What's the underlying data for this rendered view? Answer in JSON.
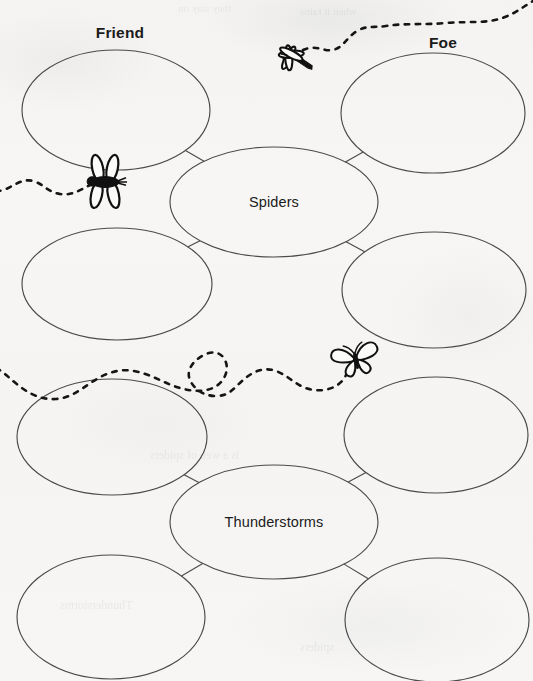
{
  "worksheet": {
    "column_headers": [
      {
        "label": "Friend",
        "x": 120,
        "y": 24
      },
      {
        "label": "Foe",
        "x": 443,
        "y": 34
      }
    ],
    "clusters": [
      {
        "center": {
          "label": "Spiders",
          "cx": 274,
          "cy": 202,
          "rx": 104,
          "ry": 55
        },
        "satellites": [
          {
            "name": "spiders-friend-top",
            "side": "friend",
            "cx": 116,
            "cy": 110,
            "rx": 94,
            "ry": 60,
            "value": ""
          },
          {
            "name": "spiders-foe-top",
            "side": "foe",
            "cx": 433,
            "cy": 113,
            "rx": 92,
            "ry": 60,
            "value": ""
          },
          {
            "name": "spiders-friend-bottom",
            "side": "friend",
            "cx": 117,
            "cy": 284,
            "rx": 95,
            "ry": 56,
            "value": ""
          },
          {
            "name": "spiders-foe-bottom",
            "side": "foe",
            "cx": 434,
            "cy": 290,
            "rx": 92,
            "ry": 58,
            "value": ""
          }
        ]
      },
      {
        "center": {
          "label": "Thunderstorms",
          "cx": 274,
          "cy": 522,
          "rx": 104,
          "ry": 57
        },
        "satellites": [
          {
            "name": "thunderstorms-friend-top",
            "side": "friend",
            "cx": 112,
            "cy": 437,
            "rx": 95,
            "ry": 58,
            "value": ""
          },
          {
            "name": "thunderstorms-foe-top",
            "side": "foe",
            "cx": 436,
            "cy": 435,
            "rx": 92,
            "ry": 58,
            "value": ""
          },
          {
            "name": "thunderstorms-friend-bottom",
            "side": "friend",
            "cx": 111,
            "cy": 617,
            "rx": 94,
            "ry": 62,
            "value": ""
          },
          {
            "name": "thunderstorms-foe-bottom",
            "side": "foe",
            "cx": 437,
            "cy": 620,
            "rx": 92,
            "ry": 62,
            "value": ""
          }
        ]
      }
    ],
    "illustrations": [
      {
        "name": "dragonfly-icon",
        "x": 290,
        "y": 56,
        "rotation": -28,
        "scale": 1.0
      },
      {
        "name": "fly-icon",
        "x": 105,
        "y": 182,
        "rotation": 0,
        "scale": 1.05
      },
      {
        "name": "butterfly-icon",
        "x": 355,
        "y": 358,
        "rotation": -12,
        "scale": 0.95
      }
    ],
    "flight_trails": [
      {
        "name": "dragonfly-trail",
        "path": "M 303 50 C 316 44 324 52 333 50 C 344 47 346 38 357 31 C 367 25 373 28 386 26 C 404 23 424 25 446 23 C 470 21 488 24 505 17 C 518 12 524 6 533 1"
      },
      {
        "name": "fly-trail",
        "path": "M 92 184 C 80 190 72 196 60 194 C 47 192 44 184 33 181 C 22 178 14 186 4 190 C -2 192 -5 190 -8 186"
      },
      {
        "name": "butterfly-trail",
        "path": "M 347 372 C 344 384 330 392 314 390 C 297 388 290 376 276 371 C 262 366 251 373 242 381 C 233 389 229 396 216 396 C 203 396 194 389 190 380 C 186 371 192 362 202 356 C 212 350 221 352 225 360 C 229 368 226 378 219 384 C 210 392 196 392 184 389 C 166 385 152 374 134 371 C 118 368 104 374 92 382 C 80 390 70 398 56 399 C 40 400 28 393 18 385 C 10 379 4 372 -4 368"
      }
    ],
    "bleed_through": [
      {
        "text": "they stay on",
        "x": 178,
        "y": 2,
        "size": 11
      },
      {
        "text": "when it rains",
        "x": 300,
        "y": 5,
        "size": 11
      },
      {
        "text": "is a web of spiders",
        "x": 150,
        "y": 448,
        "size": 12
      },
      {
        "text": "Thunderstorms",
        "x": 60,
        "y": 598,
        "size": 12
      },
      {
        "text": "spiders",
        "x": 300,
        "y": 640,
        "size": 12
      }
    ]
  },
  "colors": {
    "paper": "#f6f5f3",
    "ink": "#4a4a4a",
    "text": "#1b1b1b",
    "bug_ink": "#111111"
  }
}
